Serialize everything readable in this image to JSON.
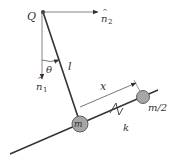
{
  "diagram": {
    "type": "pendulum-with-spring-mass-on-rail",
    "labels": {
      "pivot": "Q",
      "n2_base": "n",
      "n2_hat": "^",
      "n2_sub": "2",
      "n1_base": "n",
      "n1_hat": "^",
      "n1_sub": "1",
      "angle": "θ",
      "length": "l",
      "displacement": "x",
      "spring": "k",
      "mass": "m",
      "mass_half": "m/2"
    },
    "colors": {
      "line": "#333333",
      "axis": "#555555",
      "mass_fill": "#a6a6a6",
      "mass_stroke": "#555555"
    }
  }
}
